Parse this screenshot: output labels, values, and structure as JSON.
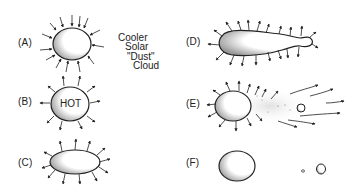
{
  "diagram": {
    "panels": [
      {
        "id": "A",
        "label": "(A)",
        "description": "Cloud contracting, arrows pointing inward"
      },
      {
        "id": "B",
        "label": "(B)",
        "description": "Hot body radiating outward",
        "inner_text": "HOT"
      },
      {
        "id": "C",
        "label": "(C)",
        "description": "Flattened body, arrows outward"
      },
      {
        "id": "D",
        "label": "(D)",
        "description": "Elongated body with bulb, arrows outward"
      },
      {
        "id": "E",
        "label": "(E)",
        "description": "Body with separated fragment and dust trail, arrows outward"
      },
      {
        "id": "F",
        "label": "(F)",
        "description": "Separated bodies: large body, tiny body and small body"
      }
    ],
    "annotation": {
      "lines": [
        "Cooler",
        "Solar",
        "\"Dust\"",
        "Cloud"
      ]
    },
    "colors": {
      "ink": "#222222",
      "background": "#ffffff",
      "shading": "#888888",
      "dust": "#bbbbbb"
    }
  }
}
